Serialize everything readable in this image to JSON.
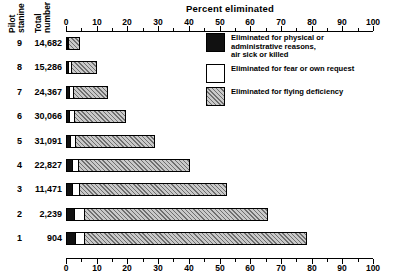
{
  "chart_data": {
    "type": "bar",
    "orientation": "horizontal",
    "stacked": true,
    "title": "Percent eliminated",
    "xlabel": "Percent eliminated",
    "ylabel": "Pilot stanine",
    "xlim": [
      0,
      100
    ],
    "xticks": [
      0,
      10,
      20,
      30,
      40,
      50,
      60,
      70,
      80,
      90,
      100
    ],
    "xticklabels": [
      "0",
      "10",
      "20",
      "30",
      "40",
      "50",
      "60",
      "70",
      "80",
      "90",
      "100"
    ],
    "minor_tick_step": 5,
    "grid": false,
    "axis_positions": [
      "top",
      "bottom"
    ],
    "legend_position": "upper right inside plot",
    "categories": [
      "9",
      "8",
      "7",
      "6",
      "5",
      "4",
      "3",
      "2",
      "1"
    ],
    "row_headers": {
      "stanine": "Pilot stanine",
      "total": "Total number"
    },
    "totals": [
      "14,682",
      "15,286",
      "24,367",
      "30,066",
      "31,091",
      "22,827",
      "11,471",
      "2,239",
      "904"
    ],
    "series": [
      {
        "name": "Eliminated for physical or administrative reasons, air sick or killed",
        "key": "admin",
        "color": "#111111",
        "values": [
          0.6,
          1.0,
          1.4,
          1.4,
          1.6,
          2.2,
          2.4,
          3.0,
          3.2
        ]
      },
      {
        "name": "Eliminated for fear or own request",
        "key": "fear",
        "color": "#ffffff",
        "values": [
          0.8,
          1.2,
          1.4,
          1.8,
          2.0,
          2.3,
          2.6,
          3.4,
          3.4
        ]
      },
      {
        "name": "Eliminated for flying deficiency",
        "key": "flying",
        "color": "#c9c9c9",
        "values": [
          3.6,
          8.6,
          11.4,
          17.0,
          26.2,
          36.5,
          48.0,
          60.0,
          72.4
        ]
      }
    ],
    "totals_percent": [
      5.0,
      10.8,
      14.2,
      20.2,
      29.8,
      41.0,
      53.0,
      66.4,
      79.0
    ]
  },
  "legend": {
    "items": [
      {
        "label": "Eliminated for physical or\nadministrative reasons,\nair sick or killed",
        "swatch": "black-swatch"
      },
      {
        "label": "Eliminated for fear or own request",
        "swatch": "white-swatch"
      },
      {
        "label": "Eliminated for flying deficiency",
        "swatch": "hatched-swatch"
      }
    ]
  }
}
